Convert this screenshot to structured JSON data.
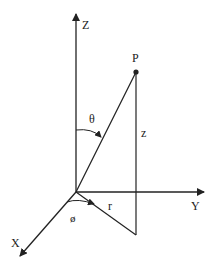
{
  "diagram": {
    "type": "spherical-cylindrical-coordinate-system",
    "colors": {
      "line": "#222222",
      "background": "#ffffff"
    },
    "axes": {
      "z": {
        "label": "Z"
      },
      "y": {
        "label": "Y"
      },
      "x": {
        "label": "X"
      }
    },
    "point": {
      "label": "P"
    },
    "annotations": {
      "theta": "θ",
      "phi": "ø",
      "r": "r",
      "z": "z"
    }
  }
}
